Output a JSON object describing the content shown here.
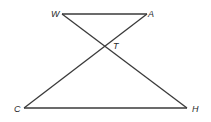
{
  "diagram": {
    "type": "geometry-figure",
    "points": {
      "W": {
        "label": "W"
      },
      "A": {
        "label": "A"
      },
      "T": {
        "label": "T"
      },
      "C": {
        "label": "C"
      },
      "H": {
        "label": "H"
      }
    },
    "segments": [
      {
        "from": "W",
        "to": "A",
        "name": "segment-WA"
      },
      {
        "from": "W",
        "to": "H",
        "name": "segment-WH"
      },
      {
        "from": "A",
        "to": "C",
        "name": "segment-AC"
      },
      {
        "from": "C",
        "to": "H",
        "name": "segment-CH"
      }
    ],
    "intersection": {
      "point": "T",
      "of": [
        "segment-WH",
        "segment-AC"
      ]
    },
    "colors": {
      "line": "#3a3a3a",
      "label": "#2a2a2a",
      "background": "#ffffff"
    }
  }
}
